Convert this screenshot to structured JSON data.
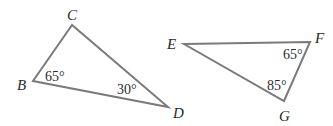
{
  "figure": {
    "triangles": [
      {
        "name": "triangle-BCD",
        "vertices": [
          "B",
          "C",
          "D"
        ],
        "angles": [
          {
            "vertex": "B",
            "label": "65°"
          },
          {
            "vertex": "D",
            "label": "30°"
          }
        ]
      },
      {
        "name": "triangle-EFG",
        "vertices": [
          "E",
          "F",
          "G"
        ],
        "angles": [
          {
            "vertex": "F",
            "label": "65°"
          },
          {
            "vertex": "G",
            "label": "85°"
          }
        ]
      }
    ],
    "line_color": "#7a7a7a",
    "text_color": "#2a2a2a"
  }
}
